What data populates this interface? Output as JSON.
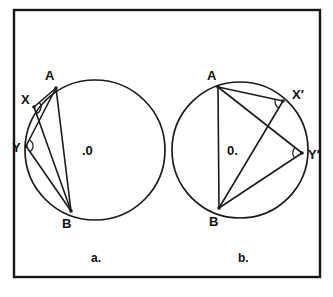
{
  "figure": {
    "type": "geometry-diagram",
    "background_color": "#ffffff",
    "ink_color": "#1a1a1a",
    "frame": {
      "stroke_color": "#16161a",
      "x": 14,
      "y": 10,
      "width": 306,
      "height": 267
    },
    "caption": "",
    "panels": [
      {
        "id": "a",
        "label": "a.",
        "label_x": 91,
        "label_y": 262,
        "circle": {
          "cx": 95,
          "cy": 150,
          "r": 70,
          "stroke_color": "#1a1a1a"
        },
        "center_label": {
          "text": ".0",
          "x": 82,
          "y": 155
        },
        "points": [
          {
            "name": "A",
            "label": "A",
            "x": 56,
            "y": 88,
            "label_x": 45,
            "label_y": 80
          },
          {
            "name": "X",
            "label": "X",
            "x": 34,
            "y": 107,
            "label_x": 21,
            "label_y": 104
          },
          {
            "name": "Y",
            "label": "Y",
            "x": 26,
            "y": 146,
            "label_x": 12,
            "label_y": 152
          },
          {
            "name": "B",
            "label": "B",
            "x": 71,
            "y": 211,
            "label_x": 62,
            "label_y": 228
          }
        ],
        "chords": [
          {
            "from": "A",
            "to": "X"
          },
          {
            "from": "A",
            "to": "Y"
          },
          {
            "from": "A",
            "to": "B"
          },
          {
            "from": "X",
            "to": "B"
          },
          {
            "from": "Y",
            "to": "B"
          }
        ],
        "angle_marks": [
          {
            "at": "X",
            "radius": 7
          },
          {
            "at": "Y",
            "radius": 7
          }
        ]
      },
      {
        "id": "b",
        "label": "b.",
        "label_x": 238,
        "label_y": 262,
        "circle": {
          "cx": 240,
          "cy": 150,
          "r": 68,
          "stroke_color": "#1a1a1a"
        },
        "center_label": {
          "text": "0.",
          "x": 227,
          "y": 155
        },
        "points": [
          {
            "name": "A",
            "label": "A",
            "x": 218,
            "y": 87,
            "label_x": 207,
            "label_y": 80
          },
          {
            "name": "X'",
            "label": "X′",
            "x": 283,
            "y": 101,
            "label_x": 292,
            "label_y": 99
          },
          {
            "name": "Y'",
            "label": "Y′",
            "x": 302,
            "y": 153,
            "label_x": 308,
            "label_y": 159
          },
          {
            "name": "B",
            "label": "B",
            "x": 219,
            "y": 208,
            "label_x": 209,
            "label_y": 226
          }
        ],
        "chords": [
          {
            "from": "A",
            "to": "X'"
          },
          {
            "from": "A",
            "to": "Y'"
          },
          {
            "from": "B",
            "to": "X'"
          },
          {
            "from": "B",
            "to": "Y'"
          },
          {
            "from": "A",
            "to": "B"
          }
        ],
        "angle_marks": [
          {
            "at": "X'",
            "radius": 8
          },
          {
            "at": "Y'",
            "radius": 9
          }
        ]
      }
    ]
  }
}
